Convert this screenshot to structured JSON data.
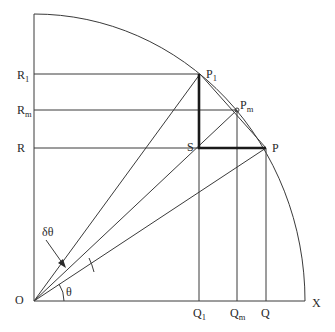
{
  "figure": {
    "origin_label": "O",
    "x_axis_label": "X",
    "angle_label": "θ",
    "delta_angle_label": "δθ",
    "points": {
      "P1": {
        "main": "P",
        "sub": "1"
      },
      "Pm": {
        "main": "P",
        "sub": "m"
      },
      "P": {
        "main": "P",
        "sub": ""
      },
      "S": {
        "main": "S",
        "sub": ""
      }
    },
    "y_axis_labels": {
      "R1": {
        "main": "R",
        "sub": "1"
      },
      "Rm": {
        "main": "R",
        "sub": "m"
      },
      "R": {
        "main": "R",
        "sub": ""
      }
    },
    "x_axis_labels": {
      "Q1": {
        "main": "Q",
        "sub": "1"
      },
      "Qm": {
        "main": "Q",
        "sub": "m"
      },
      "Q": {
        "main": "Q",
        "sub": ""
      }
    },
    "colors": {
      "line": "#3a3a3a",
      "thick_line": "#1a1a1a",
      "background": "#ffffff"
    }
  }
}
